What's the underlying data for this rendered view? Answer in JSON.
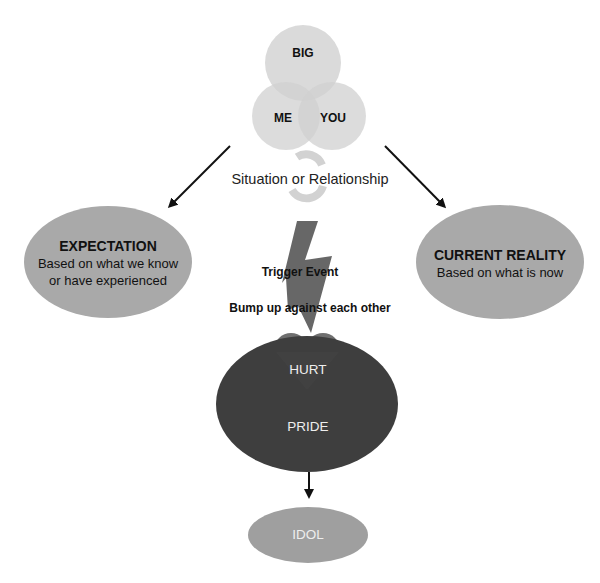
{
  "venn": {
    "big": "BIG",
    "me": "ME",
    "you": "YOU"
  },
  "situation": {
    "label": "Situation or Relationship",
    "icon": "cycle-arrows-icon"
  },
  "expectation": {
    "title": "EXPECTATION",
    "line1": "Based on what we know",
    "line2": "or have experienced"
  },
  "reality": {
    "title": "CURRENT REALITY",
    "line1": "Based on what is now"
  },
  "trigger": {
    "label": "Trigger Event",
    "sub": "Bump up against each other",
    "icon": "lightning-bolt-icon"
  },
  "core": {
    "hurt": "HURT",
    "pride": "PRIDE"
  },
  "idol": {
    "label": "IDOL"
  },
  "colors": {
    "venn_fill": "#d9d9d9",
    "ellipse_fill": "#a6a6a6",
    "pride_fill": "#3d3d3d",
    "heart_fill": "#6e6e6e",
    "bolt_fill": "#595959",
    "idol_fill": "#9e9e9e",
    "arrow": "#111111"
  }
}
